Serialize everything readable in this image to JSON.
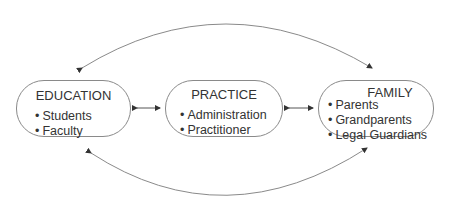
{
  "nodes": [
    {
      "id": "education",
      "title": "EDUCATION",
      "items": [
        "Students",
        "Faculty"
      ]
    },
    {
      "id": "practice",
      "title": "PRACTICE",
      "items": [
        "Administration",
        "Practitioner"
      ]
    },
    {
      "id": "family",
      "title": "FAMILY",
      "items": [
        "Parents",
        "Grandparents",
        "Legal Guardians"
      ]
    }
  ],
  "edges": [
    {
      "from": "education",
      "to": "practice",
      "type": "bidirectional-arrow"
    },
    {
      "from": "practice",
      "to": "family",
      "type": "bidirectional-arrow"
    },
    {
      "from": "education",
      "to": "family",
      "type": "bidirectional-arc-top"
    },
    {
      "from": "education",
      "to": "family",
      "type": "bidirectional-arc-bottom"
    }
  ],
  "colors": {
    "line": "#8a8a8a",
    "text": "#333333",
    "arrowhead": "#333333"
  }
}
